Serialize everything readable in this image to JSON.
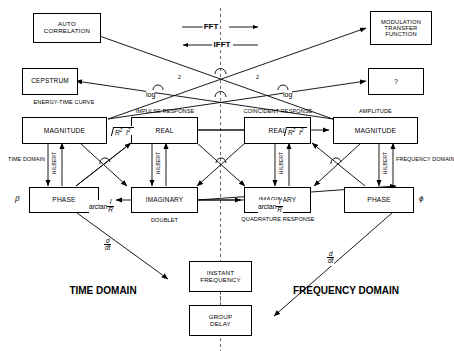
{
  "diagram": {
    "transform_labels": {
      "forward": "FFT",
      "inverse": "IFFT"
    },
    "domains": {
      "left": "TIME\nDOMAIN",
      "left_line1": "TIME",
      "left_line2": "DOMAIN",
      "right_line1": "FREQUENCY",
      "right_line2": "DOMAIN"
    },
    "boxes": {
      "auto_correlation_l1": "AUTO",
      "auto_correlation_l2": "CORRELATION",
      "modulation_l1": "MODULATION",
      "modulation_l2": "TRANSFER",
      "modulation_l3": "FUNCTION",
      "cepstrum": "CEPSTRUM",
      "question": "?",
      "magnitude_left": "MAGNITUDE",
      "real_left": "REAL",
      "real_right": "REAL",
      "magnitude_right": "MAGNITUDE",
      "phase_left": "PHASE",
      "imaginary_left": "IMAGINARY",
      "imaginary_right": "IMAGINARY",
      "phase_right": "PHASE",
      "instant_frequency_l1": "INSTANT",
      "instant_frequency_l2": "FREQUENCY",
      "group_delay_l1": "GROUP",
      "group_delay_l2": "DELAY"
    },
    "captions": {
      "energy_time_l1": "ENERGY-TIME",
      "energy_time_l2": "CURVE",
      "impulse_response": "IMPULSE RESPONSE",
      "coincident_response": "COINCIDENT RESPONSE",
      "amplitude": "AMPLITUDE",
      "doublet": "DOUBLET",
      "quadrature_l1": "QUADRATURE",
      "quadrature_l2": "RESPONSE",
      "hilbert": "HILBERT",
      "time_domain_small_l1": "TIME",
      "time_domain_small_l2": "DOMAIN",
      "freq_domain_small_l1": "FREQUENCY",
      "freq_domain_small_l2": "DOMAIN"
    },
    "math": {
      "log": "log",
      "exponent_two": "2",
      "sqrt_r": "R",
      "sqrt_i": "I",
      "sqrt_exp": "2",
      "arctan_word": "arctan",
      "arctan_num": "I",
      "arctan_den": "R",
      "ddt_num": "d",
      "ddt_den": "dt",
      "beta": "β",
      "phi": "ϕ"
    },
    "colors": {
      "line": "#000000",
      "background": "#ffffff",
      "axis_dash": "#555555"
    }
  }
}
